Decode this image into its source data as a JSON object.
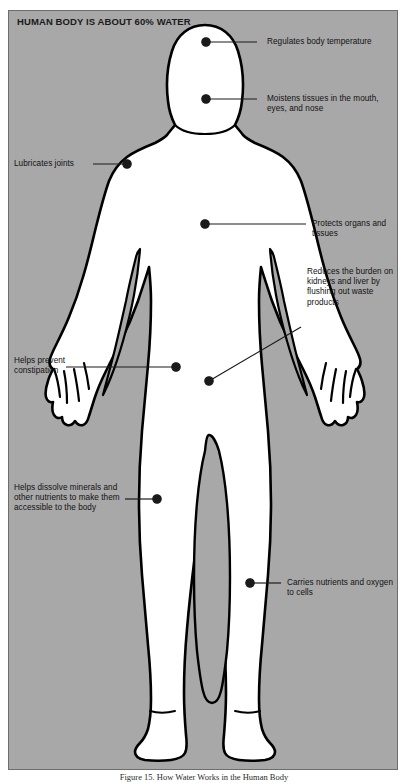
{
  "figure": {
    "panel_title": "HUMAN BODY IS ABOUT 60% WATER",
    "caption": "Figure 15. How Water Works in the Human Body",
    "panel_bg_color": "#a8a8a8",
    "body_fill_color": "#ffffff",
    "outline_color": "#000000",
    "leader_color": "#1a1a1a"
  },
  "callouts": [
    {
      "id": "regulates-body-temperature",
      "side": "right",
      "text": "Regulates body temperature",
      "dot": {
        "x": 197,
        "y": 31
      },
      "line_end": {
        "x": 248,
        "y": 31
      }
    },
    {
      "id": "moistens-tissues",
      "side": "right",
      "text": "Moistens tissues in the mouth, eyes, and nose",
      "dot": {
        "x": 197,
        "y": 88
      },
      "line_end": {
        "x": 248,
        "y": 88
      }
    },
    {
      "id": "lubricates-joints",
      "side": "left",
      "text": "Lubricates joints",
      "dot": {
        "x": 118,
        "y": 153
      },
      "line_end": {
        "x": 84,
        "y": 153
      }
    },
    {
      "id": "protects-organs-and-tissues",
      "side": "right",
      "text": "Protects organs and tissues",
      "dot": {
        "x": 196,
        "y": 213
      },
      "line_end": {
        "x": 297,
        "y": 213
      }
    },
    {
      "id": "reduces-burden-kidneys-liver",
      "side": "right",
      "text": "Reduces the burden on kidneys and liver by flushing out waste products",
      "dot": {
        "x": 200,
        "y": 370
      },
      "line_end": {
        "x": 292,
        "y": 316
      }
    },
    {
      "id": "helps-prevent-constipation",
      "side": "left",
      "text": "Helps prevent constipation",
      "dot": {
        "x": 167,
        "y": 356
      },
      "line_end": {
        "x": 57,
        "y": 356
      }
    },
    {
      "id": "helps-dissolve-minerals",
      "side": "left",
      "text": "Helps dissolve minerals and other nutrients to make them accessible to the body",
      "dot": {
        "x": 148,
        "y": 488
      },
      "line_end": {
        "x": 116,
        "y": 488
      }
    },
    {
      "id": "carries-nutrients-oxygen",
      "side": "right",
      "text": "Carries nutrients and oxygen to cells",
      "dot": {
        "x": 241,
        "y": 572
      },
      "line_end": {
        "x": 272,
        "y": 572
      }
    }
  ],
  "labels": {
    "regulates_body_temperature": "Regulates body temperature",
    "moistens_tissues": "Moistens tissues in the mouth, eyes, and nose",
    "lubricates_joints": "Lubricates joints",
    "protects_organs": "Protects organs and tissues",
    "reduces_burden": "Reduces the burden on kidneys and liver by flushing out waste products",
    "helps_prevent_constipation": "Helps prevent constipation",
    "helps_dissolve_minerals": "Helps dissolve minerals and other nutrients to make them accessible to the body",
    "carries_nutrients": "Carries nutrients and oxygen to cells"
  }
}
